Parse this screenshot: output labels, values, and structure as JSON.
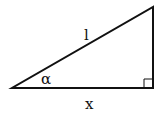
{
  "diagram": {
    "type": "right-triangle",
    "labels": {
      "hypotenuse": "l",
      "angle": "α",
      "base": "x"
    },
    "right_angle_marker": true,
    "colors": {
      "stroke": "#111111",
      "background": "#ffffff"
    }
  }
}
